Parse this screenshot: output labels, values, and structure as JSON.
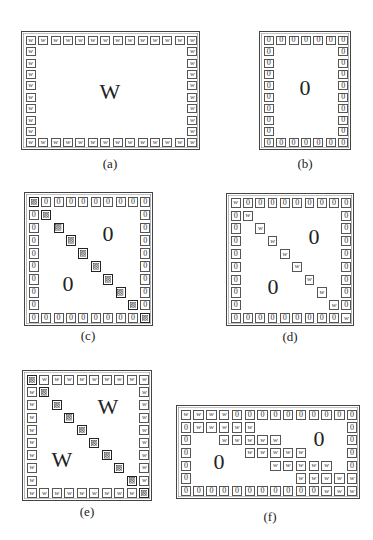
{
  "panels": [
    {
      "id": "a",
      "label": "(a)",
      "box": {
        "x": 21,
        "y": 31,
        "w": 179,
        "h": 119
      },
      "cols": 14,
      "rows": 10,
      "border_symbol": "W",
      "diagonal": false,
      "diagonal_symbol": null,
      "staircase": null,
      "big_labels": [
        {
          "text": "W",
          "x": 110,
          "y": 92
        }
      ],
      "label_pos": {
        "x": 110,
        "y": 156
      }
    },
    {
      "id": "b",
      "label": "(b)",
      "box": {
        "x": 259,
        "y": 31,
        "w": 92,
        "h": 119
      },
      "cols": 7,
      "rows": 10,
      "border_symbol": "0",
      "diagonal": false,
      "diagonal_symbol": null,
      "staircase": null,
      "big_labels": [
        {
          "text": "0",
          "x": 305,
          "y": 88
        }
      ],
      "label_pos": {
        "x": 305,
        "y": 156
      }
    },
    {
      "id": "c",
      "label": "(c)",
      "box": {
        "x": 24,
        "y": 192,
        "w": 129,
        "h": 134
      },
      "cols": 10,
      "rows": 10,
      "border_symbol": "0",
      "diagonal": true,
      "diagonal_symbol": "X",
      "staircase": null,
      "big_labels": [
        {
          "text": "0",
          "x": 108,
          "y": 234
        },
        {
          "text": "0",
          "x": 68,
          "y": 284
        }
      ],
      "label_pos": {
        "x": 88,
        "y": 328
      }
    },
    {
      "id": "d",
      "label": "(d)",
      "box": {
        "x": 226,
        "y": 193,
        "w": 128,
        "h": 133
      },
      "cols": 10,
      "rows": 10,
      "border_symbol": "0",
      "diagonal": true,
      "diagonal_symbol": "W",
      "staircase": null,
      "big_labels": [
        {
          "text": "0",
          "x": 314,
          "y": 237
        },
        {
          "text": "0",
          "x": 273,
          "y": 287
        }
      ],
      "label_pos": {
        "x": 290,
        "y": 329
      }
    },
    {
      "id": "e",
      "label": "(e)",
      "box": {
        "x": 22,
        "y": 370,
        "w": 130,
        "h": 131
      },
      "cols": 10,
      "rows": 10,
      "border_symbol": "W",
      "diagonal": true,
      "diagonal_symbol": "X",
      "staircase": null,
      "big_labels": [
        {
          "text": "W",
          "x": 108,
          "y": 407
        },
        {
          "text": "W",
          "x": 62,
          "y": 460
        }
      ],
      "label_pos": {
        "x": 87,
        "y": 504
      }
    },
    {
      "id": "f",
      "label": "(f)",
      "box": {
        "x": 176,
        "y": 405,
        "w": 184,
        "h": 94
      },
      "cols": 14,
      "rows": 7,
      "border_symbol": "0",
      "diagonal": false,
      "diagonal_symbol": null,
      "staircase": {
        "symbol": "W",
        "cells": [
          [
            0,
            0
          ],
          [
            0,
            1
          ],
          [
            0,
            2
          ],
          [
            0,
            3
          ],
          [
            1,
            1
          ],
          [
            1,
            2
          ],
          [
            1,
            3
          ],
          [
            1,
            4
          ],
          [
            1,
            5
          ],
          [
            2,
            3
          ],
          [
            2,
            4
          ],
          [
            2,
            5
          ],
          [
            2,
            6
          ],
          [
            2,
            7
          ],
          [
            3,
            5
          ],
          [
            3,
            6
          ],
          [
            3,
            7
          ],
          [
            3,
            8
          ],
          [
            3,
            9
          ],
          [
            4,
            7
          ],
          [
            4,
            8
          ],
          [
            4,
            9
          ],
          [
            4,
            10
          ],
          [
            4,
            11
          ],
          [
            5,
            9
          ],
          [
            5,
            10
          ],
          [
            5,
            11
          ],
          [
            5,
            12
          ],
          [
            5,
            13
          ],
          [
            6,
            11
          ],
          [
            6,
            12
          ],
          [
            6,
            13
          ]
        ]
      },
      "big_labels": [
        {
          "text": "0",
          "x": 319,
          "y": 439
        },
        {
          "text": "0",
          "x": 219,
          "y": 462
        }
      ],
      "label_pos": {
        "x": 270,
        "y": 509
      }
    }
  ]
}
